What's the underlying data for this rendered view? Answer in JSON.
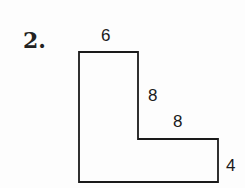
{
  "problem": {
    "number": "2.",
    "shape": "L-shaped polygon",
    "labels": {
      "top": "6",
      "inner_vertical": "8",
      "inner_horizontal": "8",
      "right": "4"
    },
    "stroke_color": "#1a1a1a"
  }
}
